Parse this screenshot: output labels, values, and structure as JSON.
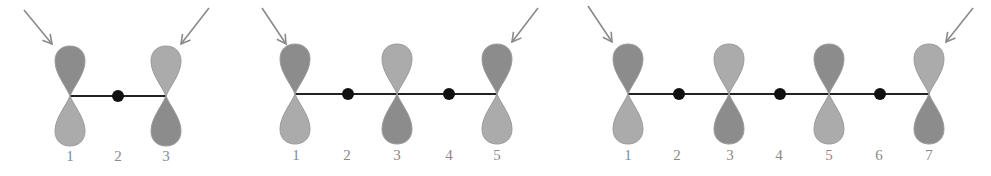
{
  "colors": {
    "lobe_dark": "#8c8c8c",
    "lobe_light": "#ababab",
    "lobe_stroke": "#9a9a9a",
    "bond": "#222222",
    "node_dot": "#111111",
    "arrow": "#8a8a8a",
    "label": "#8a8a8a"
  },
  "diagrams": [
    {
      "name": "allyl-3-atom",
      "atoms": [
        {
          "label": "1",
          "type": "orbital",
          "top": "dark"
        },
        {
          "label": "2",
          "type": "node"
        },
        {
          "label": "3",
          "type": "orbital",
          "top": "light"
        }
      ],
      "arrows": [
        "left-terminal",
        "right-terminal"
      ]
    },
    {
      "name": "pentadienyl-5-atom",
      "atoms": [
        {
          "label": "1",
          "type": "orbital",
          "top": "dark"
        },
        {
          "label": "2",
          "type": "node"
        },
        {
          "label": "3",
          "type": "orbital",
          "top": "light"
        },
        {
          "label": "4",
          "type": "node"
        },
        {
          "label": "5",
          "type": "orbital",
          "top": "dark"
        }
      ],
      "arrows": [
        "left-terminal",
        "right-terminal"
      ]
    },
    {
      "name": "heptatrienyl-7-atom",
      "atoms": [
        {
          "label": "1",
          "type": "orbital",
          "top": "dark"
        },
        {
          "label": "2",
          "type": "node"
        },
        {
          "label": "3",
          "type": "orbital",
          "top": "light"
        },
        {
          "label": "4",
          "type": "node"
        },
        {
          "label": "5",
          "type": "orbital",
          "top": "dark"
        },
        {
          "label": "6",
          "type": "node"
        },
        {
          "label": "7",
          "type": "orbital",
          "top": "light"
        }
      ],
      "arrows": [
        "left-terminal",
        "right-terminal"
      ]
    }
  ],
  "labels": {
    "d1": [
      "1",
      "2",
      "3"
    ],
    "d2": [
      "1",
      "2",
      "3",
      "4",
      "5"
    ],
    "d3": [
      "1",
      "2",
      "3",
      "4",
      "5",
      "6",
      "7"
    ]
  }
}
